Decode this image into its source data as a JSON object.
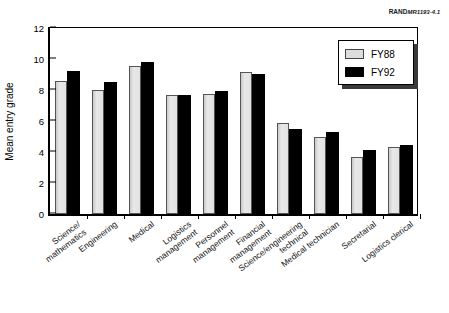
{
  "credit": {
    "organization": "RAND",
    "document": "MR1193-4.1"
  },
  "chart_data": {
    "type": "bar",
    "title": "",
    "xlabel": "",
    "ylabel": "Mean entry grade",
    "ylim": [
      0,
      12
    ],
    "yticks": [
      0,
      2,
      4,
      6,
      8,
      10,
      12
    ],
    "grid": false,
    "legend_position": "top-right",
    "categories": [
      "Science/\nmathematics",
      "Engineering",
      "Medical",
      "Logistics\nmanagement",
      "Personnel\nmanagement",
      "Financial\nmanagement",
      "Science/engineering\ntechnical",
      "Medical technician",
      "Secretarial",
      "Logistics clerical"
    ],
    "category_lines": [
      [
        "Science/",
        "mathematics"
      ],
      [
        "Engineering"
      ],
      [
        "Medical"
      ],
      [
        "Logistics",
        "management"
      ],
      [
        "Personnel",
        "management"
      ],
      [
        "Financial",
        "management"
      ],
      [
        "Science/engineering",
        "technical"
      ],
      [
        "Medical technician"
      ],
      [
        "Secretarial"
      ],
      [
        "Logistics clerical"
      ]
    ],
    "series": [
      {
        "name": "FY88",
        "color": "#dddddd",
        "values": [
          8.6,
          8.0,
          9.55,
          7.65,
          7.75,
          9.15,
          5.85,
          5.0,
          3.7,
          4.35
        ]
      },
      {
        "name": "FY92",
        "color": "#000000",
        "values": [
          9.25,
          8.5,
          9.8,
          7.65,
          7.95,
          9.05,
          5.5,
          5.3,
          4.15,
          4.45
        ]
      }
    ]
  }
}
